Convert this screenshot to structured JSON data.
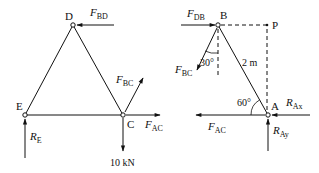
{
  "left_diagram": {
    "nodes": {
      "D": {
        "label": "D"
      },
      "E": {
        "label": "E"
      },
      "C": {
        "label": "C"
      }
    },
    "forces": {
      "F_BD": {
        "main": "F",
        "sub": "BD"
      },
      "F_BC": {
        "main": "F",
        "sub": "BC"
      },
      "F_AC": {
        "main": "F",
        "sub": "AC"
      },
      "R_E": {
        "main": "R",
        "sub": "E"
      },
      "load": "10 kN"
    }
  },
  "right_diagram": {
    "nodes": {
      "B": {
        "label": "B"
      },
      "P": {
        "label": "P"
      },
      "A": {
        "label": "A"
      }
    },
    "forces": {
      "F_DB": {
        "main": "F",
        "sub": "DB"
      },
      "F_BC": {
        "main": "F",
        "sub": "BC"
      },
      "F_AC": {
        "main": "F",
        "sub": "AC"
      },
      "R_Ax": {
        "main": "R",
        "sub": "Ax"
      },
      "R_Ay": {
        "main": "R",
        "sub": "Ay"
      }
    },
    "annotations": {
      "angle_B": "30°",
      "length_AB": "2 m",
      "angle_A": "60°"
    }
  },
  "colors": {
    "stroke": "#111111",
    "background": "#ffffff"
  }
}
